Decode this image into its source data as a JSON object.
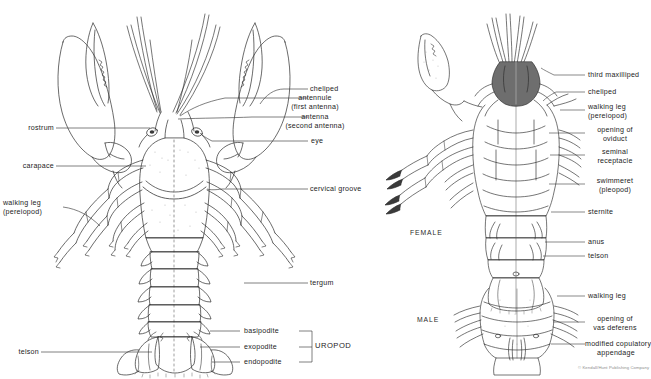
{
  "figure": {
    "credit": "© Kendall/Hunt Publishing Company",
    "top_faint_text": "",
    "ink_color": "#2b2b2b",
    "leader_color": "#3a3a3a",
    "shade_color": "#d9d9d9",
    "text_color": "#1c1c1c"
  },
  "left_figure": {
    "name": "dorsal-view",
    "labels": {
      "rostrum": "rostrum",
      "carapace": "carapace",
      "walking_leg": "walking  leg",
      "walking_leg_alt": "(pereiopod)",
      "telson": "telson",
      "cheliped": "cheliped",
      "antennule": "antennule",
      "antennule_alt": "(first  antenna)",
      "antenna": "antenna",
      "antenna_alt": "(second  antenna)",
      "eye": "eye",
      "cervical_groove": "cervical  groove",
      "tergum": "tergum",
      "basipodite": "basipodite",
      "exopodite": "exopodite",
      "endopodite": "endopodite",
      "uropod_group": "UROPOD"
    }
  },
  "right_figure": {
    "name": "ventral-view",
    "female_label": "FEMALE",
    "male_label": "MALE",
    "labels": {
      "third_maxilliped": "third  maxilliped",
      "cheliped": "cheliped",
      "walking_leg": "walking  leg",
      "walking_leg_alt": "(pereiopod)",
      "opening_of_oviduct": "opening  of",
      "opening_of_oviduct_alt": "oviduct",
      "seminal_receptacle": "seminal",
      "seminal_receptacle_alt": "receptacle",
      "swimmeret": "swimmeret",
      "swimmeret_alt": "(pleopod)",
      "sternite": "sternite",
      "anus": "anus",
      "telson": "telson",
      "male_walking_leg": "walking  leg",
      "opening_of_vas_deferens": "opening  of",
      "opening_of_vas_deferens_alt": "vas  deferens",
      "modified_copulatory": "modified  copulatory",
      "modified_copulatory_alt": "appendage"
    }
  }
}
